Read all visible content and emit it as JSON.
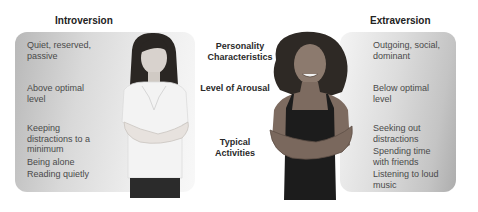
{
  "headings": {
    "left": "Introversion",
    "right": "Extraversion"
  },
  "center_labels": [
    "Personality Characteristics",
    "Level of Arousal",
    "Typical Activities"
  ],
  "introversion": {
    "personality": "Quiet, reserved, passive",
    "arousal": "Above optimal level",
    "activities": [
      "Keeping distractions to a minimum",
      "Being alone",
      "Reading quietly"
    ]
  },
  "extraversion": {
    "personality": "Outgoing, social, dominant",
    "arousal": "Below optimal level",
    "activities": [
      "Seeking out distractions",
      "Spending time with friends",
      "Listening to loud music"
    ]
  },
  "figures": {
    "left": "introverted-woman-photo",
    "right": "extraverted-woman-photo"
  }
}
